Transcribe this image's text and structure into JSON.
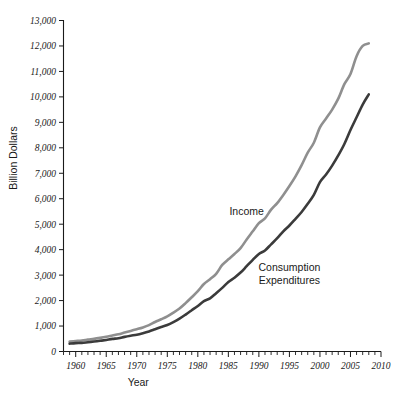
{
  "chart_data": {
    "type": "line",
    "title": "",
    "xlabel": "Year",
    "ylabel": "Billion Dollars",
    "xlim": [
      1958,
      2010
    ],
    "ylim": [
      0,
      13000
    ],
    "grid": false,
    "legend_position": "inline-annotations",
    "x_ticks": [
      1960,
      1965,
      1970,
      1975,
      1980,
      1985,
      1990,
      1995,
      2000,
      2005,
      2010
    ],
    "x_tick_labels": [
      "1960",
      "1965",
      "1970",
      "1975",
      "1980",
      "1985",
      "1990",
      "1995",
      "2000",
      "2005",
      "2010"
    ],
    "x_minor_tick_step": 1,
    "y_ticks": [
      0,
      1000,
      2000,
      3000,
      4000,
      5000,
      6000,
      7000,
      8000,
      9000,
      10000,
      11000,
      12000,
      13000
    ],
    "y_tick_labels": [
      "0",
      "1,000",
      "2,000",
      "3,000",
      "4,000",
      "5,000",
      "6,000",
      "7,000",
      "8,000",
      "9,000",
      "10,000",
      "11,000",
      "12,000",
      "13,000"
    ],
    "x": [
      1959,
      1960,
      1961,
      1962,
      1963,
      1964,
      1965,
      1966,
      1967,
      1968,
      1969,
      1970,
      1971,
      1972,
      1973,
      1974,
      1975,
      1976,
      1977,
      1978,
      1979,
      1980,
      1981,
      1982,
      1983,
      1984,
      1985,
      1986,
      1987,
      1988,
      1989,
      1990,
      1991,
      1992,
      1993,
      1994,
      1995,
      1996,
      1997,
      1998,
      1999,
      2000,
      2001,
      2002,
      2003,
      2004,
      2005,
      2006,
      2007,
      2008
    ],
    "series": [
      {
        "name": "Income",
        "color": "#8f8f8f",
        "label": "Income",
        "label_x": 1988,
        "label_y": 5350,
        "values": [
          390,
          410,
          430,
          465,
          495,
          535,
          580,
          630,
          680,
          745,
          810,
          875,
          945,
          1035,
          1160,
          1265,
          1380,
          1525,
          1690,
          1900,
          2130,
          2370,
          2650,
          2840,
          3050,
          3400,
          3620,
          3830,
          4060,
          4400,
          4720,
          5040,
          5230,
          5570,
          5830,
          6150,
          6500,
          6880,
          7320,
          7810,
          8200,
          8800,
          9150,
          9500,
          9930,
          10500,
          10900,
          11600,
          12000,
          12100
        ]
      },
      {
        "name": "Consumption Expenditures",
        "color": "#3b3b3b",
        "label": "Consumption\nExpenditures",
        "label_lines": [
          "Consumption",
          "Expenditures"
        ],
        "label_x": 1995,
        "label_y": 3150,
        "values": [
          310,
          330,
          340,
          365,
          390,
          420,
          455,
          495,
          520,
          575,
          620,
          660,
          720,
          790,
          875,
          960,
          1040,
          1155,
          1290,
          1450,
          1620,
          1790,
          1980,
          2090,
          2290,
          2500,
          2730,
          2900,
          3100,
          3350,
          3600,
          3830,
          3970,
          4210,
          4450,
          4720,
          4950,
          5210,
          5480,
          5800,
          6150,
          6650,
          6950,
          7300,
          7700,
          8150,
          8700,
          9200,
          9700,
          10100
        ]
      }
    ]
  },
  "axis": {
    "y_title": "Billion Dollars",
    "x_title": "Year"
  }
}
